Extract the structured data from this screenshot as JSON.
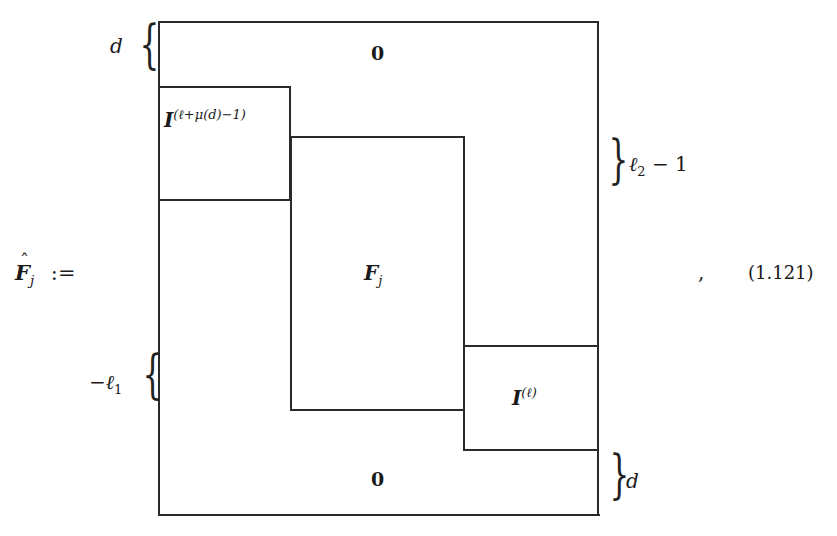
{
  "equation": {
    "lhs": {
      "symbol": "F",
      "hat": "ˆ",
      "subscript": "j",
      "operator": ":="
    },
    "blocks": {
      "top_zero": "0",
      "identity_top": {
        "symbol": "I",
        "superscript": "(ℓ+μ(d)−1)"
      },
      "center": {
        "symbol": "F",
        "subscript": "j"
      },
      "identity_bottom": {
        "symbol": "I",
        "superscript": "(ℓ)"
      },
      "bottom_zero": "0"
    },
    "brace_labels": {
      "top_left": "d",
      "right_upper": {
        "base": "ℓ",
        "subscript": "2",
        "rest": " − 1"
      },
      "left_lower": {
        "prefix": "−ℓ",
        "subscript": "1"
      },
      "bottom_right": "d"
    },
    "trailing_punctuation": ",",
    "number": "(1.121)"
  }
}
